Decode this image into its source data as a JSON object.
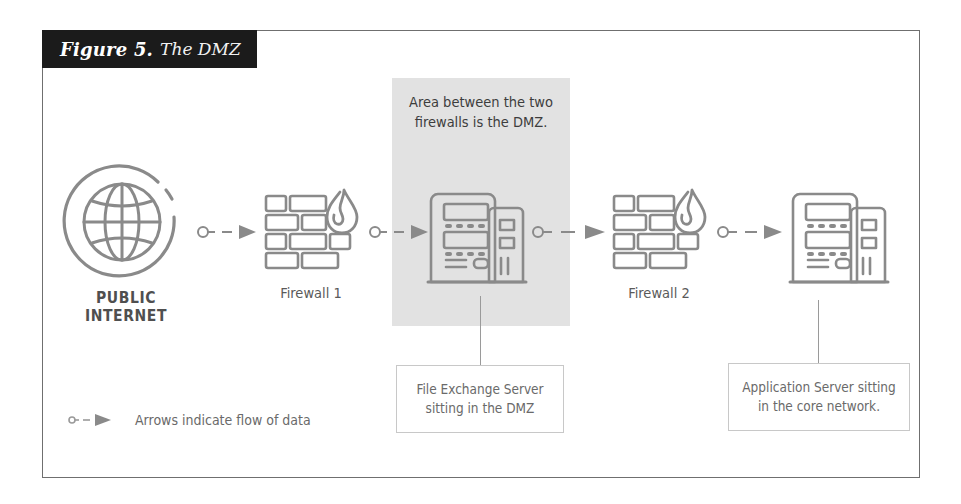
{
  "figure": {
    "label": "Figure 5.",
    "title": "The DMZ"
  },
  "dmz": {
    "caption": "Area between the two\nfirewalls is the DMZ."
  },
  "nodes": [
    {
      "id": "internet",
      "icon": "globe-icon",
      "label": "PUBLIC\nINTERNET"
    },
    {
      "id": "firewall-1",
      "icon": "firewall-icon",
      "label": "Firewall 1"
    },
    {
      "id": "dmz-server",
      "icon": "server-icon",
      "label": ""
    },
    {
      "id": "firewall-2",
      "icon": "firewall-icon",
      "label": "Firewall 2"
    },
    {
      "id": "app-server",
      "icon": "server-icon",
      "label": ""
    }
  ],
  "callouts": [
    {
      "id": "dmz-server-callout",
      "text": "File Exchange Server\nsitting in the DMZ"
    },
    {
      "id": "app-server-callout",
      "text": "Application Server sitting\nin the core network."
    }
  ],
  "legend": {
    "icon": "arrow-flow-icon",
    "text": "Arrows indicate flow of data"
  },
  "colors": {
    "banner_bg": "#1b1b1b",
    "banner_fg": "#ffffff",
    "dmz_band": "#e2e2e2",
    "frame_border": "#6f6f6f",
    "icon_stroke": "#8a8a8a",
    "label_text": "#5a5a5a",
    "callout_border": "#c8c8c8"
  }
}
